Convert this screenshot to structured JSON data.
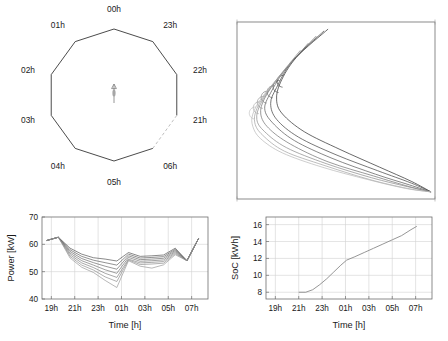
{
  "figure": {
    "title": "",
    "panel_count": 4,
    "background": "#ffffff"
  },
  "panels": {
    "polar": {
      "name": "hour-polygon-plot",
      "type": "polygon",
      "vertex_count": 10,
      "labels": [
        "00h",
        "23h",
        "22h",
        "21h",
        "06h",
        "05h",
        "04h",
        "03h",
        "02h",
        "01h"
      ],
      "dashed_edge_between": [
        "21h",
        "06h"
      ],
      "center_marker": "small-vertical-arrow",
      "edge_color": "#2b2b2b",
      "dashed_edge_color": "#b4b4b4"
    },
    "curves": {
      "name": "trajectory-curves-plot",
      "type": "line",
      "box_only": true,
      "xlabel": "",
      "ylabel": "",
      "curve_count": 7,
      "description": "Nested swooping curves rising to an apex at upper area then converging to the lower-right corner",
      "colors": [
        "#2a2a2a",
        "#3d3d3d",
        "#555555",
        "#6e6e6e",
        "#888888",
        "#a0a0a0",
        "#b8b8b8"
      ]
    },
    "power": {
      "name": "power-time-chart",
      "xlabel": "Time [h]",
      "ylabel": "Power [kW]"
    },
    "soc": {
      "name": "soc-time-chart",
      "xlabel": "Time [h]",
      "ylabel": "SoC [kWh]"
    }
  },
  "chart_data": [
    {
      "type": "line",
      "name": "hour-polygon",
      "title": "",
      "xlabel": "",
      "ylabel": "",
      "categories": [
        "00h",
        "23h",
        "22h",
        "21h",
        "06h",
        "05h",
        "04h",
        "03h",
        "02h",
        "01h"
      ],
      "values": [
        1,
        1,
        1,
        1,
        1,
        1,
        1,
        1,
        1,
        1
      ],
      "grid": false,
      "legend": "none",
      "notes": "Regular decagon; vertices labelled by hour, clockwise from 00h at top. Edge from 21h to 06h drawn dashed light gray."
    },
    {
      "type": "line",
      "name": "trajectory-curves",
      "title": "",
      "xlabel": "",
      "ylabel": "",
      "xlim": [
        0,
        1
      ],
      "ylim": [
        0,
        1
      ],
      "grid": false,
      "legend": "none",
      "series": [
        {
          "name": "curve-1",
          "color": "#2a2a2a",
          "x": [
            0.46,
            0.3,
            0.22,
            0.2,
            0.23,
            0.34,
            0.52,
            0.72,
            0.88,
            0.98
          ],
          "y": [
            0.96,
            0.8,
            0.66,
            0.56,
            0.48,
            0.38,
            0.28,
            0.18,
            0.1,
            0.04
          ]
        },
        {
          "name": "curve-2",
          "color": "#3d3d3d",
          "x": [
            0.44,
            0.28,
            0.2,
            0.17,
            0.2,
            0.31,
            0.5,
            0.71,
            0.88,
            0.98
          ],
          "y": [
            0.95,
            0.78,
            0.63,
            0.54,
            0.45,
            0.35,
            0.25,
            0.16,
            0.09,
            0.04
          ]
        },
        {
          "name": "curve-3",
          "color": "#555555",
          "x": [
            0.4,
            0.25,
            0.17,
            0.14,
            0.18,
            0.29,
            0.48,
            0.7,
            0.87,
            0.98
          ],
          "y": [
            0.92,
            0.74,
            0.6,
            0.51,
            0.43,
            0.33,
            0.23,
            0.14,
            0.08,
            0.04
          ]
        },
        {
          "name": "curve-4",
          "color": "#6e6e6e",
          "x": [
            0.36,
            0.22,
            0.14,
            0.12,
            0.16,
            0.27,
            0.46,
            0.69,
            0.87,
            0.98
          ],
          "y": [
            0.88,
            0.7,
            0.57,
            0.48,
            0.4,
            0.31,
            0.21,
            0.13,
            0.07,
            0.04
          ]
        },
        {
          "name": "curve-5",
          "color": "#888888",
          "x": [
            0.32,
            0.19,
            0.12,
            0.1,
            0.14,
            0.25,
            0.45,
            0.68,
            0.86,
            0.98
          ],
          "y": [
            0.84,
            0.66,
            0.54,
            0.45,
            0.38,
            0.29,
            0.2,
            0.12,
            0.07,
            0.04
          ]
        },
        {
          "name": "curve-6",
          "color": "#a0a0a0",
          "x": [
            0.28,
            0.16,
            0.1,
            0.09,
            0.13,
            0.24,
            0.44,
            0.67,
            0.86,
            0.98
          ],
          "y": [
            0.78,
            0.62,
            0.51,
            0.43,
            0.36,
            0.27,
            0.19,
            0.11,
            0.06,
            0.04
          ]
        },
        {
          "name": "curve-7",
          "color": "#b8b8b8",
          "x": [
            0.24,
            0.13,
            0.08,
            0.08,
            0.12,
            0.23,
            0.43,
            0.66,
            0.85,
            0.98
          ],
          "y": [
            0.72,
            0.58,
            0.48,
            0.41,
            0.34,
            0.26,
            0.18,
            0.11,
            0.06,
            0.04
          ]
        }
      ]
    },
    {
      "type": "line",
      "name": "power-profile",
      "title": "",
      "xlabel": "Time [h]",
      "ylabel": "Power [kW]",
      "xticklabels": [
        "19h",
        "21h",
        "23h",
        "01h",
        "03h",
        "05h",
        "07h"
      ],
      "xtickvalues": [
        19,
        21,
        23,
        25,
        27,
        29,
        31
      ],
      "xlim": [
        18.2,
        32.4
      ],
      "yticklabels": [
        "40",
        "50",
        "60",
        "70"
      ],
      "ytickvalues": [
        40,
        50,
        60,
        70
      ],
      "ylim": [
        40,
        70
      ],
      "grid": true,
      "legend": "none",
      "x": [
        18.6,
        19.6,
        20.6,
        21.6,
        22.6,
        23.6,
        24.6,
        25.6,
        26.6,
        27.6,
        28.6,
        29.6,
        30.6,
        31.6
      ],
      "series": [
        {
          "name": "band-1-upper",
          "color": "#4a4a4a",
          "values": [
            61.4,
            62.6,
            58.6,
            56.4,
            55.1,
            54.6,
            53.9,
            57.0,
            55.6,
            55.8,
            56.1,
            58.6,
            54.0,
            62.2
          ]
        },
        {
          "name": "band-2",
          "color": "#565656",
          "values": [
            61.4,
            62.6,
            58.0,
            55.6,
            54.2,
            53.3,
            52.4,
            56.4,
            55.0,
            55.2,
            55.5,
            58.2,
            54.0,
            62.2
          ]
        },
        {
          "name": "band-3",
          "color": "#626262",
          "values": [
            61.4,
            62.6,
            57.4,
            54.8,
            53.3,
            52.0,
            50.9,
            55.8,
            54.4,
            54.6,
            54.9,
            57.8,
            54.0,
            62.2
          ]
        },
        {
          "name": "band-4",
          "color": "#6e6e6e",
          "values": [
            61.4,
            62.6,
            56.8,
            54.0,
            52.4,
            50.7,
            49.4,
            55.2,
            53.8,
            54.0,
            54.3,
            57.4,
            54.0,
            62.2
          ]
        },
        {
          "name": "band-5",
          "color": "#7a7a7a",
          "values": [
            61.4,
            62.6,
            56.2,
            53.2,
            51.5,
            49.4,
            47.9,
            54.6,
            53.2,
            53.4,
            53.7,
            57.0,
            54.0,
            62.2
          ]
        },
        {
          "name": "band-6",
          "color": "#868686",
          "values": [
            61.4,
            62.6,
            55.6,
            52.4,
            50.6,
            48.1,
            46.4,
            54.3,
            52.6,
            52.8,
            53.1,
            56.6,
            54.0,
            62.2
          ]
        },
        {
          "name": "band-7-lower",
          "color": "#929292",
          "values": [
            61.4,
            62.6,
            55.0,
            51.6,
            49.7,
            46.8,
            44.2,
            54.0,
            52.0,
            51.3,
            52.5,
            56.2,
            54.0,
            62.2
          ]
        }
      ]
    },
    {
      "type": "line",
      "name": "soc-profile",
      "title": "",
      "xlabel": "Time [h]",
      "ylabel": "SoC [kWh]",
      "xticklabels": [
        "19h",
        "21h",
        "23h",
        "01h",
        "03h",
        "05h",
        "07h"
      ],
      "xtickvalues": [
        19,
        21,
        23,
        25,
        27,
        29,
        31
      ],
      "xlim": [
        18.2,
        32.4
      ],
      "yticklabels": [
        "8",
        "10",
        "12",
        "14",
        "16"
      ],
      "ytickvalues": [
        8,
        10,
        12,
        14,
        16
      ],
      "ylim": [
        7.2,
        16.9
      ],
      "grid": true,
      "legend": "none",
      "color": "#8a8a8a",
      "x": [
        21.0,
        21.6,
        22.2,
        22.8,
        23.4,
        24.0,
        24.6,
        25.1,
        25.8,
        26.6,
        27.4,
        28.2,
        29.0,
        29.8,
        30.6,
        31.1
      ],
      "values": [
        8.0,
        8.0,
        8.3,
        8.9,
        9.6,
        10.4,
        11.2,
        11.8,
        12.2,
        12.7,
        13.2,
        13.7,
        14.2,
        14.7,
        15.4,
        15.8
      ]
    }
  ]
}
